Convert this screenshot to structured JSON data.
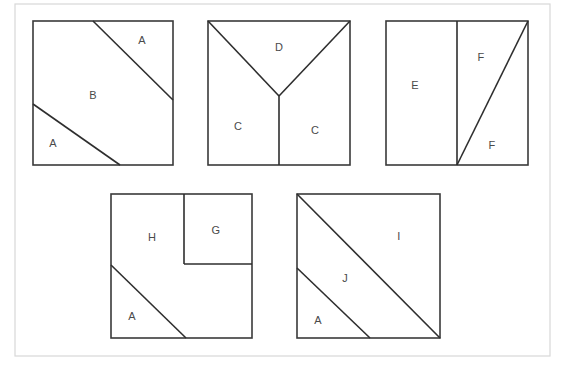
{
  "page": {
    "background_color": "#ffffff",
    "frame_color": "#d8d8d8",
    "line_color": "#2e2e2e",
    "label_color": "#4a4a4a"
  },
  "frame": {
    "x": 15,
    "y": 4,
    "width": 535,
    "height": 352
  },
  "figures": [
    {
      "id": "figure-1",
      "name": "square-1",
      "x": 33,
      "y": 21,
      "width": 140,
      "height": 144,
      "lines": [
        {
          "name": "upper-diagonal",
          "x1": 93,
          "y1": 21,
          "x2": 173,
          "y2": 100
        },
        {
          "name": "lower-diagonal",
          "x1": 33,
          "y1": 104,
          "x2": 120,
          "y2": 165
        }
      ],
      "labels": [
        {
          "name": "region-a-upper",
          "text": "A",
          "x": 142,
          "y": 41
        },
        {
          "name": "region-b",
          "text": "B",
          "x": 93,
          "y": 96
        },
        {
          "name": "region-a-lower",
          "text": "A",
          "x": 53,
          "y": 144
        }
      ]
    },
    {
      "id": "figure-2",
      "name": "square-2",
      "x": 208,
      "y": 21,
      "width": 142,
      "height": 144,
      "lines": [
        {
          "name": "left-diagonal",
          "x1": 208,
          "y1": 21,
          "x2": 279,
          "y2": 96
        },
        {
          "name": "right-diagonal",
          "x1": 350,
          "y1": 21,
          "x2": 279,
          "y2": 96
        },
        {
          "name": "center-vertical",
          "x1": 279,
          "y1": 96,
          "x2": 279,
          "y2": 165
        }
      ],
      "labels": [
        {
          "name": "region-d",
          "text": "D",
          "x": 279,
          "y": 48
        },
        {
          "name": "region-c-left",
          "text": "C",
          "x": 238,
          "y": 127
        },
        {
          "name": "region-c-right",
          "text": "C",
          "x": 315,
          "y": 131
        }
      ]
    },
    {
      "id": "figure-3",
      "name": "square-3",
      "x": 386,
      "y": 21,
      "width": 142,
      "height": 144,
      "lines": [
        {
          "name": "vertical-divider",
          "x1": 457,
          "y1": 21,
          "x2": 457,
          "y2": 165
        },
        {
          "name": "right-diagonal",
          "x1": 457,
          "y1": 165,
          "x2": 528,
          "y2": 21
        }
      ],
      "labels": [
        {
          "name": "region-e",
          "text": "E",
          "x": 415,
          "y": 86
        },
        {
          "name": "region-f-upper",
          "text": "F",
          "x": 481,
          "y": 58
        },
        {
          "name": "region-f-lower",
          "text": "F",
          "x": 492,
          "y": 146
        }
      ]
    },
    {
      "id": "figure-4",
      "name": "square-4",
      "x": 111,
      "y": 194,
      "width": 141,
      "height": 144,
      "lines": [
        {
          "name": "inner-square-left",
          "x1": 184,
          "y1": 194,
          "x2": 184,
          "y2": 264
        },
        {
          "name": "inner-square-bottom",
          "x1": 184,
          "y1": 264,
          "x2": 252,
          "y2": 264
        },
        {
          "name": "lower-diagonal",
          "x1": 111,
          "y1": 265,
          "x2": 186,
          "y2": 338
        }
      ],
      "labels": [
        {
          "name": "region-h",
          "text": "H",
          "x": 152,
          "y": 238
        },
        {
          "name": "region-g",
          "text": "G",
          "x": 216,
          "y": 231
        },
        {
          "name": "region-a",
          "text": "A",
          "x": 132,
          "y": 317
        }
      ]
    },
    {
      "id": "figure-5",
      "name": "square-5",
      "x": 297,
      "y": 194,
      "width": 143,
      "height": 144,
      "lines": [
        {
          "name": "main-diagonal",
          "x1": 297,
          "y1": 194,
          "x2": 440,
          "y2": 338
        },
        {
          "name": "lower-diagonal",
          "x1": 297,
          "y1": 268,
          "x2": 370,
          "y2": 338
        }
      ],
      "labels": [
        {
          "name": "region-i",
          "text": "I",
          "x": 399,
          "y": 237
        },
        {
          "name": "region-j",
          "text": "J",
          "x": 345,
          "y": 279
        },
        {
          "name": "region-a",
          "text": "A",
          "x": 318,
          "y": 321
        }
      ]
    }
  ]
}
